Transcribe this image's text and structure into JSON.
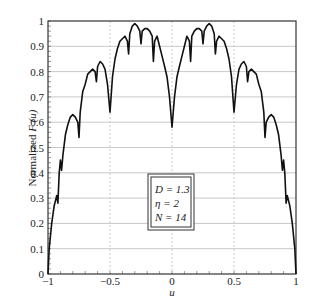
{
  "chart_data": {
    "type": "line",
    "title": "",
    "xlabel": "u",
    "ylabel": "Normalized F (u)",
    "xlim": [
      -1,
      1
    ],
    "ylim": [
      0,
      1
    ],
    "grid": true,
    "x_ticks": [
      "-1",
      "-0.5",
      "0",
      "0.5",
      "1"
    ],
    "y_ticks": [
      "0",
      "0.1",
      "0.2",
      "0.3",
      "0.4",
      "0.5",
      "0.6",
      "0.7",
      "0.8",
      "0.9",
      "1"
    ],
    "legend": {
      "position": "center-lower",
      "entries": [
        "D = 1.3",
        "η = 2",
        "N = 14"
      ]
    },
    "series": [
      {
        "name": "Normalized F(u)",
        "x": [
          -1,
          -0.99,
          -0.97,
          -0.95,
          -0.93,
          -0.92,
          -0.91,
          -0.9,
          -0.89,
          -0.88,
          -0.86,
          -0.84,
          -0.82,
          -0.8,
          -0.78,
          -0.76,
          -0.75,
          -0.74,
          -0.72,
          -0.7,
          -0.68,
          -0.66,
          -0.64,
          -0.62,
          -0.61,
          -0.6,
          -0.58,
          -0.56,
          -0.54,
          -0.52,
          -0.5,
          -0.48,
          -0.46,
          -0.44,
          -0.42,
          -0.4,
          -0.38,
          -0.36,
          -0.35,
          -0.34,
          -0.32,
          -0.3,
          -0.28,
          -0.26,
          -0.25,
          -0.24,
          -0.22,
          -0.2,
          -0.18,
          -0.16,
          -0.15,
          -0.14,
          -0.12,
          -0.1,
          -0.08,
          -0.06,
          -0.04,
          -0.02,
          0,
          0.02,
          0.04,
          0.06,
          0.08,
          0.1,
          0.12,
          0.14,
          0.15,
          0.16,
          0.18,
          0.2,
          0.22,
          0.24,
          0.25,
          0.26,
          0.28,
          0.3,
          0.32,
          0.34,
          0.35,
          0.36,
          0.38,
          0.4,
          0.42,
          0.44,
          0.46,
          0.48,
          0.5,
          0.52,
          0.54,
          0.56,
          0.58,
          0.6,
          0.61,
          0.62,
          0.64,
          0.66,
          0.68,
          0.7,
          0.72,
          0.74,
          0.75,
          0.76,
          0.78,
          0.8,
          0.82,
          0.84,
          0.86,
          0.88,
          0.89,
          0.9,
          0.91,
          0.92,
          0.93,
          0.95,
          0.97,
          0.99,
          1
        ],
        "y": [
          0,
          0.1,
          0.2,
          0.27,
          0.31,
          0.28,
          0.4,
          0.45,
          0.41,
          0.47,
          0.55,
          0.59,
          0.62,
          0.63,
          0.62,
          0.6,
          0.54,
          0.64,
          0.72,
          0.75,
          0.79,
          0.8,
          0.81,
          0.8,
          0.76,
          0.82,
          0.84,
          0.83,
          0.81,
          0.75,
          0.64,
          0.78,
          0.85,
          0.89,
          0.92,
          0.93,
          0.94,
          0.92,
          0.87,
          0.95,
          0.98,
          0.99,
          0.98,
          0.96,
          0.91,
          0.96,
          0.97,
          0.97,
          0.96,
          0.94,
          0.84,
          0.92,
          0.94,
          0.9,
          0.86,
          0.82,
          0.78,
          0.7,
          0.58,
          0.7,
          0.78,
          0.82,
          0.86,
          0.9,
          0.94,
          0.92,
          0.84,
          0.94,
          0.96,
          0.97,
          0.97,
          0.96,
          0.91,
          0.96,
          0.98,
          0.99,
          0.98,
          0.95,
          0.87,
          0.92,
          0.94,
          0.93,
          0.92,
          0.89,
          0.85,
          0.78,
          0.64,
          0.75,
          0.81,
          0.83,
          0.84,
          0.82,
          0.76,
          0.8,
          0.81,
          0.8,
          0.79,
          0.75,
          0.72,
          0.64,
          0.54,
          0.6,
          0.62,
          0.63,
          0.62,
          0.59,
          0.55,
          0.47,
          0.41,
          0.45,
          0.4,
          0.28,
          0.31,
          0.27,
          0.2,
          0.1,
          0
        ]
      }
    ]
  },
  "colors": {
    "line": "#111111",
    "grid": "#c8c8c8",
    "axis": "#333333"
  }
}
